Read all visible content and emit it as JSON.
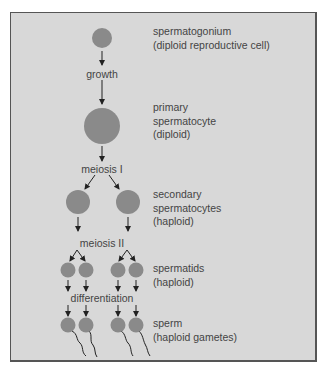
{
  "colors": {
    "background": "#d8d8d8",
    "frame_border": "#555555",
    "cell_fill": "#8a8a8a",
    "text": "#444444",
    "arrow": "#222222"
  },
  "stages": [
    {
      "name": "spermatogonium",
      "line1": "spermatogonium",
      "line2": "(diploid reproductive cell)"
    },
    {
      "name": "primary-spermatocyte",
      "line1": "primary",
      "line2": "spermatocyte",
      "line3": "(diploid)"
    },
    {
      "name": "secondary-spermatocytes",
      "line1": "secondary",
      "line2": "spermatocytes",
      "line3": "(haploid)"
    },
    {
      "name": "spermatids",
      "line1": "spermatids",
      "line2": "(haploid)"
    },
    {
      "name": "sperm",
      "line1": "sperm",
      "line2": "(haploid gametes)"
    }
  ],
  "processes": {
    "growth": "growth",
    "meiosis1": "meiosis I",
    "meiosis2": "meiosis II",
    "differentiation": "differentiation"
  }
}
